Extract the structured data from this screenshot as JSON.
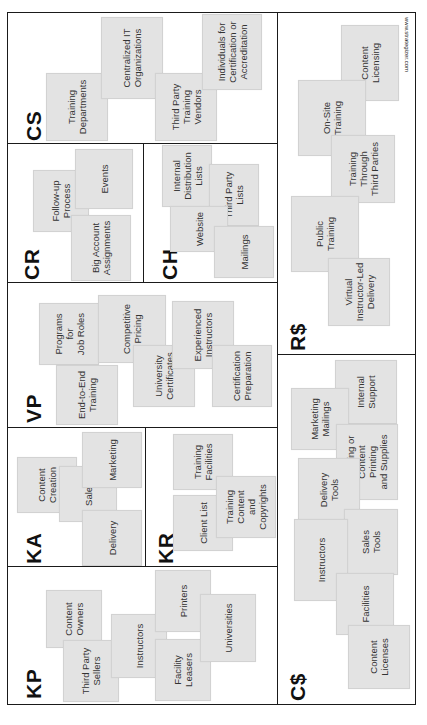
{
  "canvas": {
    "credit": "www.strategizer.com",
    "sections": {
      "cs": {
        "code": "CS",
        "notes": [
          "Training\nDepartments",
          "Centralized IT\nOrganizations",
          "Third Party\nTraining\nVendors",
          "Individuals for\nCertification or\nAccreditation"
        ]
      },
      "cr": {
        "code": "CR",
        "notes": [
          "Follow-up\nProcess",
          "Events",
          "Big Account\nAssignments"
        ]
      },
      "ch": {
        "code": "CH",
        "notes": [
          "Internal\nDistribution\nLists",
          "Third Party\nLists",
          "Website",
          "Mailings"
        ]
      },
      "vp": {
        "code": "VP",
        "notes": [
          "Programs\nfor\nJob Roles",
          "Competitive\nPricing",
          "End-to-End\nTraining",
          "University\nCertificates",
          "Experienced\nInstructors",
          "Certification\nPreparation"
        ]
      },
      "ka": {
        "code": "KA",
        "notes": [
          "Content\nCreation",
          "Sales",
          "Marketing",
          "Delivery"
        ]
      },
      "kr": {
        "code": "KR",
        "notes": [
          "Training\nFacilities",
          "Client List",
          "Training\nContent\nand\nCopyrights"
        ]
      },
      "kp": {
        "code": "KP",
        "notes": [
          "Content\nOwners",
          "Third Party\nSellers",
          "Instructors",
          "Printers",
          "Facility\nLeasers",
          "Universities"
        ]
      },
      "rs": {
        "code": "R$",
        "notes": [
          "Content\nLicensing",
          "On-Site\nTraining",
          "Training\nThrough\nThird Parties",
          "Public\nTraining",
          "Virtual\nInstructor-Led\nDelivery"
        ]
      },
      "cost": {
        "code": "C$",
        "notes": [
          "Internal\nSupport",
          "Marketing\nMailings",
          "Marketing or\nContent\nPrinting\nand Supplies",
          "Delivery\nTools",
          "Sales\nTools",
          "Instructors",
          "Facilities",
          "Content\nLicenses"
        ]
      }
    }
  }
}
